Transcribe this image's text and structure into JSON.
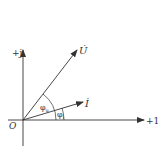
{
  "diagram": {
    "type": "phasor-diagram",
    "axes": {
      "imaginary_label": "+j",
      "real_label": "+1",
      "origin_label": "O"
    },
    "vectors": [
      {
        "name": "U",
        "label": "U̇"
      },
      {
        "name": "I",
        "label": "İ"
      }
    ],
    "angles": [
      {
        "name": "phi_u",
        "label": "φ",
        "subscript": "u"
      },
      {
        "name": "phi_i",
        "label": "φ",
        "subscript": "i"
      }
    ],
    "colors": {
      "stroke": "#333333",
      "background": "#ffffff"
    }
  }
}
